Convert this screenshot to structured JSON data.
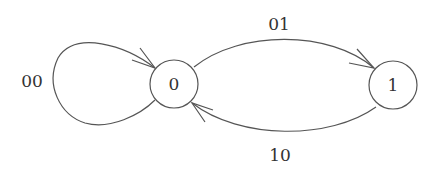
{
  "diagram": {
    "type": "state-transition",
    "states": [
      {
        "id": "s0",
        "label": "0"
      },
      {
        "id": "s1",
        "label": "1"
      }
    ],
    "transitions": [
      {
        "from": "0",
        "to": "0",
        "label": "00"
      },
      {
        "from": "0",
        "to": "1",
        "label": "01"
      },
      {
        "from": "1",
        "to": "0",
        "label": "10"
      }
    ],
    "colors": {
      "stroke": "#555555",
      "text": "#333333",
      "background": "#ffffff"
    }
  }
}
